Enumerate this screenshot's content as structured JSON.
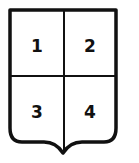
{
  "figure": {
    "type": "heraldic-shield",
    "division": "quarterly",
    "quarters": [
      {
        "label": "1"
      },
      {
        "label": "2"
      },
      {
        "label": "3"
      },
      {
        "label": "4"
      }
    ],
    "colors": {
      "stroke": "#111111",
      "fill": "#ffffff"
    }
  }
}
